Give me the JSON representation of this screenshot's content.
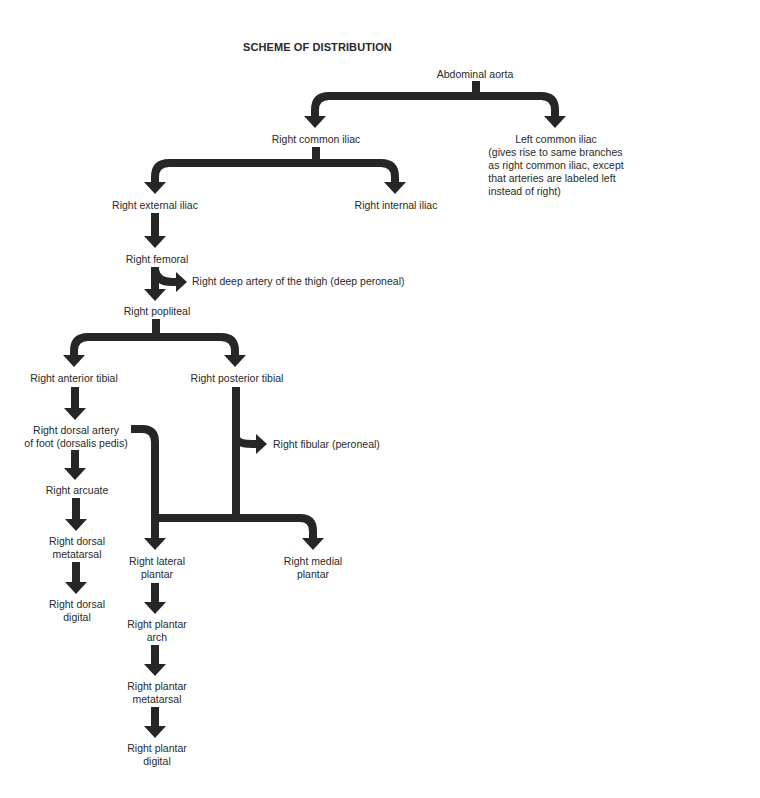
{
  "title": "SCHEME OF DISTRIBUTION",
  "colors": {
    "arrow": "#262626",
    "text": "#2a2a2a",
    "background": "#ffffff"
  },
  "nodes": {
    "abdominal_aorta": "Abdominal aorta",
    "right_common_iliac": "Right common iliac",
    "left_common_iliac": [
      "Left common iliac",
      "(gives rise to same branches",
      "as right common iliac, except",
      "that arteries are labeled left",
      "instead of right)"
    ],
    "right_external_iliac": "Right external iliac",
    "right_internal_iliac": "Right internal iliac",
    "right_femoral": "Right femoral",
    "right_deep_artery_thigh": "Right deep artery of the thigh (deep peroneal)",
    "right_popliteal": "Right popliteal",
    "right_anterior_tibial": "Right anterior tibial",
    "right_posterior_tibial": "Right posterior tibial",
    "right_dorsal_artery_foot": [
      "Right dorsal artery",
      "of foot (dorsalis pedis)"
    ],
    "right_fibular": "Right fibular (peroneal)",
    "right_arcuate": "Right arcuate",
    "right_dorsal_metatarsal": [
      "Right dorsal",
      "metatarsal"
    ],
    "right_dorsal_digital": [
      "Right dorsal",
      "digital"
    ],
    "right_lateral_plantar": [
      "Right lateral",
      "plantar"
    ],
    "right_medial_plantar": [
      "Right medial",
      "plantar"
    ],
    "right_plantar_arch": [
      "Right plantar",
      "arch"
    ],
    "right_plantar_metatarsal": [
      "Right plantar",
      "metatarsal"
    ],
    "right_plantar_digital": [
      "Right plantar",
      "digital"
    ]
  }
}
